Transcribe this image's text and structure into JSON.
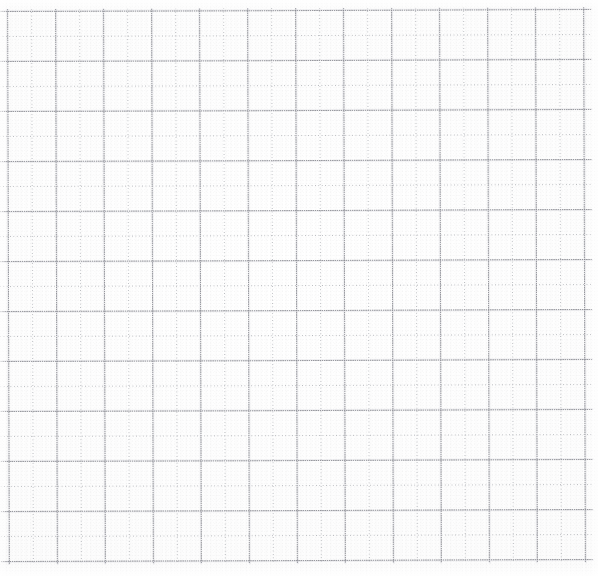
{
  "document": {
    "kind": "graph-paper-scan",
    "description": "Scanned blank square grid / graph paper sheet",
    "width_px": 598,
    "height_px": 576,
    "background_color": "#fefefe",
    "has_text": false,
    "has_handwriting": false,
    "has_ui_chrome": false
  },
  "grid": {
    "origin_x_px": 8,
    "origin_y_px": 10,
    "column_spacing_px": 24,
    "row_spacing_px": 25,
    "vertical_line_count": 25,
    "horizontal_line_count": 23,
    "last_vertical_x_px": 584,
    "last_horizontal_y_px": 560,
    "major_line_color": "#787a80",
    "minor_line_color": "#a8aab0",
    "line_style": "dotted",
    "major_every_n": 1,
    "alternating": true,
    "rotation_deg": -0.18
  },
  "scan": {
    "noise_color": "#969699",
    "paper_tint": "#fdfdfd",
    "vignette_color": "#ffffff"
  }
}
